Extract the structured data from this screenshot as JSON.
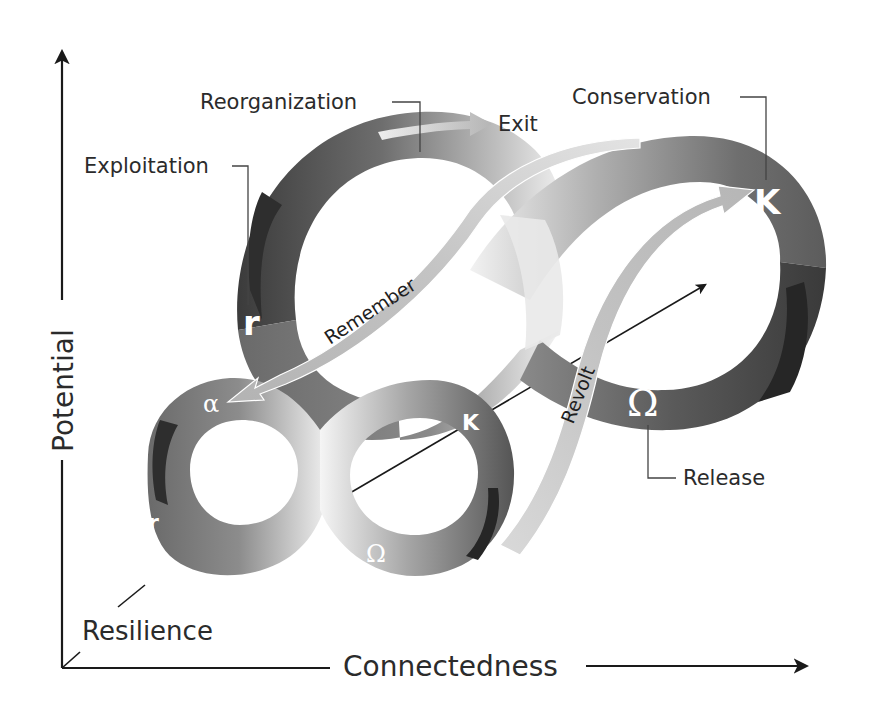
{
  "figure": {
    "type": "panarchy-adaptive-cycle-diagram",
    "axes": {
      "y_label": "Potential",
      "x_label": "Connectedness",
      "z_label": "Resilience"
    },
    "large_cycle": {
      "phases": {
        "reorganization": {
          "label": "Reorganization",
          "symbol": "α"
        },
        "exploitation": {
          "label": "Exploitation",
          "symbol": "r"
        },
        "conservation": {
          "label": "Conservation",
          "symbol": "K"
        },
        "release": {
          "label": "Release",
          "symbol": "Ω"
        }
      },
      "exit_label": "Exit"
    },
    "small_cycle": {
      "symbols": {
        "alpha": "α",
        "r": "r",
        "k": "K",
        "omega": "Ω"
      }
    },
    "cross_scale_links": {
      "remember": "Remember",
      "revolt": "Revolt"
    },
    "colors": {
      "ribbon_dark": "#3a3a3a",
      "ribbon_mid": "#7a7a7a",
      "ribbon_light": "#e8e8e8",
      "arrow_fill": "#b8b8b8",
      "axis": "#1a1a1a",
      "text": "#2b2b2b"
    }
  }
}
